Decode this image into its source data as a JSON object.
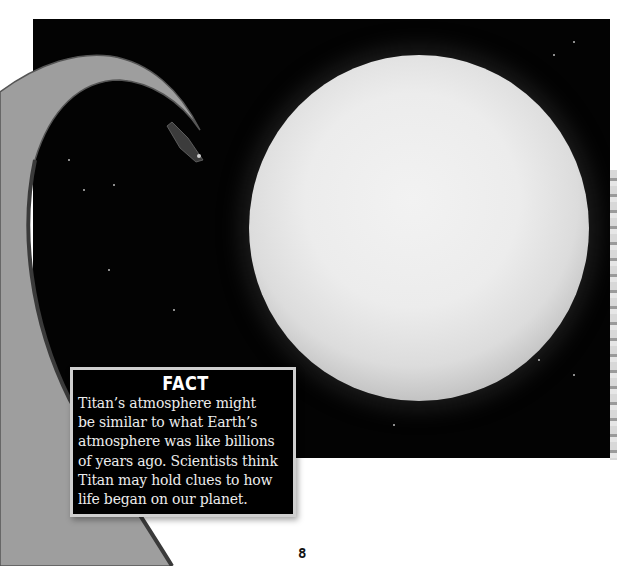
{
  "fact_box": {
    "title": "FACT",
    "text": "Titan’s atmosphere might\nbe similar to what Earth’s\natmosphere was like billions\nof years ago. Scientists think\nTitan may hold clues to how\nlife began on our planet."
  },
  "page": {
    "number": "8"
  },
  "image": {
    "subject": "Titan moon photo with spacecraft flight path",
    "colors": {
      "space": "#030303",
      "planet": "#ececec",
      "swoosh": "#9e9e9e",
      "swoosh_edge": "#555555",
      "fact_border": "#cfcfcf"
    }
  }
}
